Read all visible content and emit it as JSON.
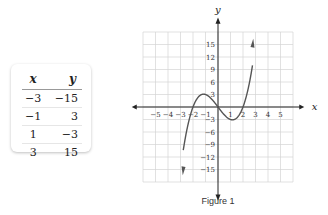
{
  "table": {
    "headers": {
      "x": "x",
      "y": "y"
    },
    "rows": [
      {
        "x": "−3",
        "y": "−15"
      },
      {
        "x": "−1",
        "y": "3"
      },
      {
        "x": "1",
        "y": "−3"
      },
      {
        "x": "3",
        "y": "15"
      }
    ]
  },
  "figure": {
    "caption": "Figure 1"
  },
  "chart_data": {
    "type": "line",
    "title": "",
    "xlabel": "x",
    "ylabel": "y",
    "xlim": [
      -6,
      6
    ],
    "ylim": [
      -18,
      18
    ],
    "x_ticks": [
      -5,
      -4,
      -3,
      -2,
      -1,
      1,
      2,
      3,
      4,
      5
    ],
    "y_ticks": [
      -15,
      -12,
      -9,
      -6,
      -3,
      3,
      6,
      9,
      12,
      15
    ],
    "grid": true,
    "legend": null,
    "series": [
      {
        "name": "y = x^3 - 4x",
        "x": [
          -3,
          -2,
          -1,
          0,
          1,
          2,
          3
        ],
        "y": [
          -15,
          0,
          3,
          0,
          -3,
          0,
          15
        ]
      }
    ],
    "table_points": [
      [
        -3,
        -15
      ],
      [
        -1,
        3
      ],
      [
        1,
        -3
      ],
      [
        3,
        15
      ]
    ]
  }
}
